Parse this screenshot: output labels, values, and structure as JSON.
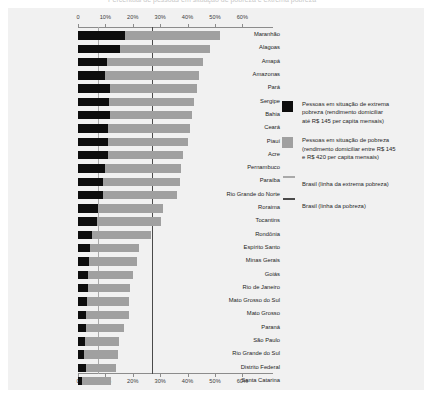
{
  "title_strip": "Percentual de pessoas em situação de pobreza e extrema pobreza",
  "chart_data": {
    "type": "bar",
    "orientation": "horizontal",
    "stacked": true,
    "title": "Percentual de pessoas em situação de pobreza e extrema pobreza",
    "xlabel": "",
    "ylabel": "",
    "xlim": [
      0,
      65
    ],
    "xticks": [
      0,
      10,
      20,
      30,
      40,
      50,
      60
    ],
    "xtick_labels": [
      "0",
      "10%",
      "20%",
      "30%",
      "40%",
      "50%",
      "60%"
    ],
    "grid": false,
    "legend_position": "right",
    "categories": [
      "Maranhão",
      "Alagoas",
      "Amapá",
      "Amazonas",
      "Pará",
      "Sergipe",
      "Bahia",
      "Ceará",
      "Piauí",
      "Acre",
      "Pernambuco",
      "Paraíba",
      "Rio Grande do Norte",
      "Roraima",
      "Tocantins",
      "Rondônia",
      "Espírito Santo",
      "Minas Gerais",
      "Goiás",
      "Rio de Janeiro",
      "Mato Grosso do Sul",
      "Mato Grosso",
      "Paraná",
      "São Paulo",
      "Rio Grande do Sul",
      "Distrito Federal",
      "Santa Catarina"
    ],
    "series": [
      {
        "name": "Pessoas em situação de extrema pobreza (rendimento domiciliar até R$ 145 per capita mensais)",
        "short_name": "extrema pobreza",
        "color": "#0d0d0d",
        "values": [
          17.0,
          15.2,
          10.5,
          10.0,
          11.5,
          11.2,
          11.5,
          11.0,
          11.0,
          11.0,
          10.0,
          9.2,
          9.0,
          7.2,
          6.8,
          5.0,
          4.2,
          4.0,
          3.6,
          3.8,
          3.2,
          3.0,
          2.8,
          2.6,
          2.2,
          2.8,
          1.6
        ]
      },
      {
        "name": "Pessoas em situação de pobreza (rendimento domiciliar entre R$ 145 e R$ 420 per capita mensais)",
        "short_name": "pobreza",
        "color": "#a0a0a0",
        "values": [
          35.0,
          32.8,
          35.0,
          34.0,
          32.0,
          31.3,
          30.0,
          30.0,
          29.0,
          27.5,
          27.5,
          28.0,
          27.0,
          24.0,
          23.5,
          21.5,
          18.0,
          17.5,
          16.5,
          15.0,
          15.5,
          15.5,
          14.0,
          12.5,
          12.5,
          11.2,
          10.5
        ]
      }
    ],
    "totals": [
      52.0,
      48.0,
      45.5,
      44.0,
      43.5,
      42.5,
      41.5,
      41.0,
      40.0,
      38.5,
      37.5,
      37.2,
      36.0,
      31.2,
      30.3,
      26.5,
      22.2,
      21.5,
      20.1,
      18.8,
      18.7,
      18.5,
      16.8,
      15.1,
      14.7,
      14.0,
      12.1
    ],
    "reference_lines": [
      {
        "label": "Brasil (linha da extrema pobreza)",
        "value": 7.3,
        "color": "#a9a9a9"
      },
      {
        "label": "Brasil (linha da pobreza)",
        "value": 27.0,
        "color": "#4a4a4a"
      }
    ]
  },
  "legend": {
    "items": [
      {
        "swatch": "extreme",
        "lines": [
          "Pessoas em situação de extrema",
          "pobreza (rendimento domiciliar",
          "até R$ 145 per capita mensais)"
        ]
      },
      {
        "swatch": "poverty",
        "lines": [
          "Pessoas em situação de pobreza",
          "(rendimento domiciliar entre R$ 145",
          "e R$ 420 per capita mensais)"
        ]
      }
    ],
    "line_items": [
      {
        "swatch": "extreme",
        "label": "Brasil (linha da extrema pobreza)"
      },
      {
        "swatch": "poverty",
        "label": "Brasil (linha da pobreza)"
      }
    ]
  }
}
